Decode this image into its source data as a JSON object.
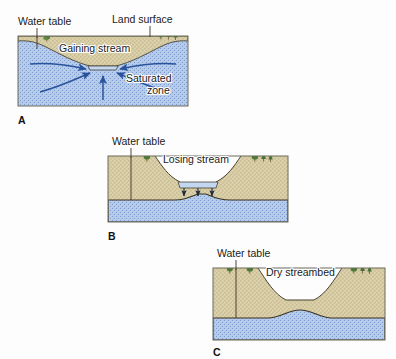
{
  "figure": {
    "background_color": "#fdfdfd",
    "width": 396,
    "height": 359
  },
  "colors": {
    "saturated_zone_fill": "#b9cdec",
    "saturated_zone_stipple": "#6d8fc4",
    "unsaturated_zone_fill": "#ddd3ab",
    "unsaturated_zone_stipple": "#9a8c60",
    "stream_water_fill": "#c3d8f0",
    "outline": "#4a4332",
    "water_table_line": "#3c3322",
    "arrow_color": "#29539b",
    "tree_color": "#4f7a38",
    "text_color": "#1a1a1a",
    "panel_border": "#6b6b5a"
  },
  "panels": [
    {
      "letter": "A",
      "labels": {
        "water_table": "Water table",
        "land_surface": "Land surface",
        "stream": "Gaining stream",
        "zone": "Saturated\nzone",
        "zone_line1": "Saturated",
        "zone_line2": "zone"
      },
      "arrow_count": 5,
      "arrow_direction": "toward-stream",
      "description": "Gaining stream: groundwater flows from the saturated zone into the stream"
    },
    {
      "letter": "B",
      "labels": {
        "water_table": "Water table",
        "stream": "Losing stream"
      },
      "arrow_count": 3,
      "arrow_direction": "downward",
      "description": "Losing stream: stream water seeps downward to the water table"
    },
    {
      "letter": "C",
      "labels": {
        "water_table": "Water table",
        "stream": "Dry streambed"
      },
      "arrow_count": 0,
      "arrow_direction": "none",
      "description": "Dry streambed: water table lies below the streambed"
    }
  ]
}
